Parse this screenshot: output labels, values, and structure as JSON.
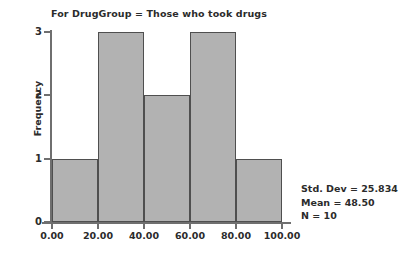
{
  "chart_data": {
    "type": "bar",
    "title": "For DrugGroup = Those who took drugs",
    "xlabel": "",
    "ylabel": "Frequency",
    "categories": [
      "0.00-20.00",
      "20.00-40.00",
      "40.00-60.00",
      "60.00-80.00",
      "80.00-100.00"
    ],
    "bin_edges": [
      0,
      20,
      40,
      60,
      80,
      100
    ],
    "values": [
      1,
      3,
      2,
      3,
      1
    ],
    "xlim": [
      0,
      100
    ],
    "ylim": [
      0,
      3
    ],
    "xticks": [
      "0.00",
      "20.00",
      "40.00",
      "60.00",
      "80.00",
      "100.00"
    ],
    "xtick_values": [
      0,
      20,
      40,
      60,
      80,
      100
    ],
    "yticks": [
      "0",
      "1",
      "2",
      "3"
    ],
    "ytick_values": [
      0,
      1,
      2,
      3
    ],
    "grid": false,
    "legend": false,
    "bar_fill_color": "#b2b2b2",
    "bar_border_color": "#4f4f4f",
    "axis_color": "#6f6f6f",
    "text_color": "#2b2b2b",
    "background_color": "#ffffff"
  },
  "annotations": {
    "std_dev": "Std. Dev = 25.834",
    "mean": "Mean = 48.50",
    "n": "N = 10"
  }
}
